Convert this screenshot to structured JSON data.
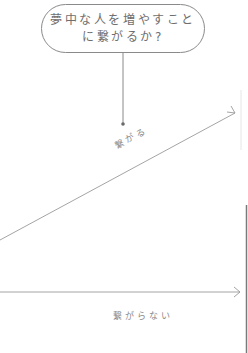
{
  "question": {
    "line1": "夢中な人を増やすこと",
    "line2": "に繋がるか?"
  },
  "branches": [
    {
      "label": "繋がる",
      "direction": "up-right"
    },
    {
      "label": "繋がらない",
      "direction": "right"
    }
  ],
  "colors": {
    "stroke": "#8a8a8a",
    "text": "#6e6e6e",
    "edge_bar": "#7a7a7a"
  }
}
